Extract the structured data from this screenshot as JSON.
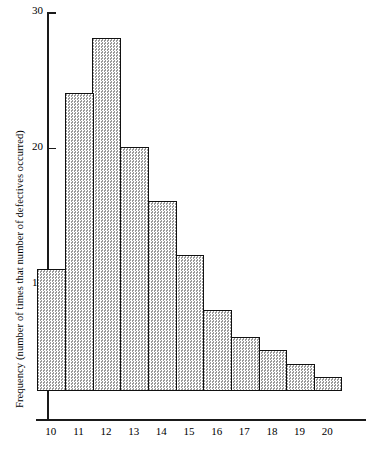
{
  "chart_data": {
    "type": "bar",
    "title": "",
    "subtitle": "",
    "xlabel": "",
    "ylabel": "Frequency (number of times that number of defectives occurred)",
    "categories": [
      "10",
      "11",
      "12",
      "13",
      "14",
      "15",
      "16",
      "17",
      "18",
      "19",
      "20"
    ],
    "values": [
      9,
      22,
      26,
      18,
      14,
      10,
      6,
      4,
      3,
      2,
      1
    ],
    "series": [
      {
        "name": "Frequency",
        "values": [
          9,
          22,
          26,
          18,
          14,
          10,
          6,
          4,
          3,
          2,
          1
        ]
      }
    ],
    "ylim": [
      0,
      30
    ],
    "xlim": [
      "10",
      "20"
    ],
    "y_ticks": [
      10,
      20,
      30
    ],
    "y_tick_labels": [
      "10",
      "20",
      "30"
    ],
    "x_tick_labels": [
      "10",
      "11",
      "12",
      "13",
      "14",
      "15",
      "16",
      "17",
      "18",
      "19",
      "20"
    ],
    "grid": false,
    "legend": false,
    "legend_position": "none",
    "bar_fill": "#dedede",
    "bar_fill_pattern": "fine-checkerboard-stipple",
    "bar_edge_color": "#111111",
    "axis_color": "#1a1a1a",
    "background": "#ffffff",
    "annotations": []
  }
}
